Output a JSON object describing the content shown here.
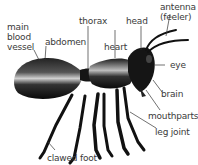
{
  "diagram": {
    "labels": {
      "main_blood_vessel": "main\nblood\nvessel",
      "abdomen": "abdomen",
      "thorax": "thorax",
      "head": "head",
      "antenna": "antenna\n(feeler)",
      "heart": "heart",
      "eye": "eye",
      "brain": "brain",
      "mouthparts": "mouthparts",
      "leg_joint": "leg joint",
      "clawed_foot": "clawed foot"
    },
    "colors": {
      "label_text": "#3a3a3a",
      "leader_line": "#333333",
      "body": "#111111",
      "highlight": "#d8d8d8"
    }
  }
}
